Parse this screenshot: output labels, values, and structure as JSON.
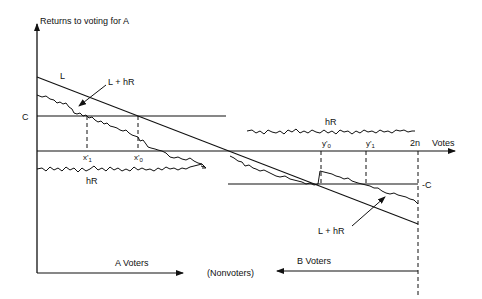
{
  "diagram": {
    "y_axis_label": "Returns to voting for A",
    "x_axis_label": "Votes",
    "labels": {
      "L": "L",
      "L_plus_hR_top": "L + hR",
      "L_plus_hR_bottom": "L + hR",
      "C": "C",
      "neg_C": "-C",
      "hR_left": "hR",
      "hR_right": "hR",
      "x1_prime": "x'",
      "x1_sub": "1",
      "x0_prime": "x'",
      "x0_sub": "0",
      "y0_prime": "y'",
      "y0_sub": "0",
      "y1_prime": "y'",
      "y1_sub": "1",
      "two_n": "2n"
    },
    "bottom": {
      "a_voters": "A  Voters",
      "nonvoters": "(Nonvoters)",
      "b_voters": "B  Voters"
    },
    "colors": {
      "line": "#111111",
      "background": "#ffffff"
    }
  }
}
